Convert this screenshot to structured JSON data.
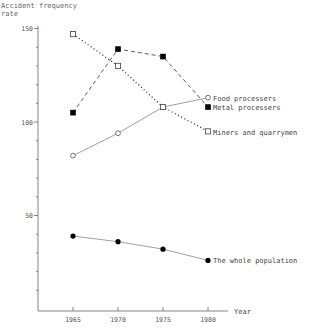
{
  "chart_data": {
    "type": "line",
    "title": "",
    "ylabel": "Accident frequency rate",
    "ylabel_lines": [
      "Accident frequency",
      "rate"
    ],
    "xlabel": "Year",
    "x": [
      1965,
      1970,
      1975,
      1980
    ],
    "xticks": [
      "1965",
      "1970",
      "1975",
      "1980"
    ],
    "ylim": [
      0,
      150
    ],
    "yticks_labeled": [
      50,
      100,
      150
    ],
    "ytick_labels": [
      "50",
      "100",
      "150"
    ],
    "yminor_step": 10,
    "grid": false,
    "legend_position": "inline labels at right end of each series",
    "series": [
      {
        "name": "Food processers",
        "marker": "open-circle",
        "line": "solid",
        "values": [
          82,
          94,
          108,
          113
        ]
      },
      {
        "name": "Metal processers",
        "marker": "filled-square",
        "line": "dashed",
        "values": [
          105,
          139,
          135,
          108
        ]
      },
      {
        "name": "Miners and quarrymen",
        "marker": "open-square",
        "line": "dotted",
        "values": [
          147,
          130,
          108,
          95
        ]
      },
      {
        "name": "The whole population",
        "marker": "filled-circle",
        "line": "solid",
        "values": [
          39,
          36,
          32,
          26
        ]
      }
    ]
  },
  "labels": {
    "food": "Food processers",
    "metal": "Metal processers",
    "miners": "Miners and quarrymen",
    "population": "The whole population"
  }
}
